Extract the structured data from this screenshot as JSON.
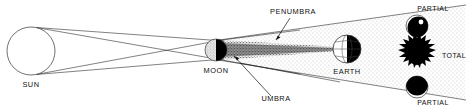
{
  "diagram": {
    "background_color": "#ffffff",
    "line_color": "#111111",
    "shadow_dark_color": "#000000",
    "labels": {
      "sun": "SUN",
      "moon": "MOON",
      "earth": "EARTH",
      "penumbra": "PENUMBRA",
      "umbra": "UMBRA"
    },
    "bodies": [
      {
        "name": "sun",
        "label": "SUN",
        "cx": 31,
        "cy": 51,
        "r": 24,
        "fill": "open-circle"
      },
      {
        "name": "moon",
        "label": "MOON",
        "cx": 216,
        "cy": 50,
        "r": 11,
        "fill": "half-shaded"
      },
      {
        "name": "earth",
        "label": "EARTH",
        "cx": 347,
        "cy": 49,
        "r": 14,
        "fill": "globe-terminator"
      }
    ],
    "shadow_regions": [
      {
        "name": "penumbra",
        "label": "PENUMBRA",
        "style": "light-stipple",
        "leader_from": [
          292,
          14
        ],
        "leader_to": [
          277,
          38
        ]
      },
      {
        "name": "umbra",
        "label": "UMBRA",
        "style": "dark-taper",
        "leader_from": [
          275,
          97
        ],
        "leader_to": [
          233,
          57
        ]
      }
    ],
    "eclipse_views": [
      {
        "name": "partial-top",
        "label": "PARTIAL",
        "appearance": "mostly-dark-disc-with-light-upper-right",
        "cx": 417,
        "cy": 26,
        "r": 11
      },
      {
        "name": "total",
        "label": "TOTAL",
        "appearance": "black-disc-with-corona",
        "cx": 417,
        "cy": 55,
        "r": 11
      },
      {
        "name": "partial-bottom",
        "label": "PARTIAL",
        "appearance": "dark-disc-with-light-lower-crescent",
        "cx": 417,
        "cy": 87,
        "r": 11
      }
    ]
  }
}
